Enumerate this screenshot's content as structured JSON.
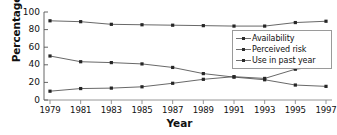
{
  "chart_data": {
    "type": "line",
    "title": "",
    "xlabel": "Year",
    "ylabel": "Percentage",
    "categories": [
      "1979",
      "1981",
      "1983",
      "1985",
      "1987",
      "1989",
      "1991",
      "1993",
      "1995",
      "1997"
    ],
    "x": [
      1979,
      1981,
      1983,
      1985,
      1987,
      1989,
      1991,
      1993,
      1995,
      1997
    ],
    "xlim": [
      1978,
      1998
    ],
    "ylim": [
      0,
      100
    ],
    "yticks": [
      0,
      20,
      40,
      60,
      80,
      100
    ],
    "ytick_labels": [
      "0",
      "20",
      "40",
      "60",
      "80",
      "100"
    ],
    "grid": false,
    "legend_position": "upper right",
    "marker": "square",
    "series": [
      {
        "name": "Availability",
        "color": "#4d4d4d",
        "values": [
          90,
          89,
          86,
          85.5,
          85,
          84.5,
          84,
          84,
          88,
          89.5
        ]
      },
      {
        "name": "Perceived risk",
        "color": "#4d4d4d",
        "values": [
          50,
          43.5,
          42.5,
          41,
          37,
          30,
          26,
          23,
          17,
          15.5
        ]
      },
      {
        "name": "Use in past year",
        "color": "#4d4d4d",
        "values": [
          10,
          13,
          13.5,
          15,
          19,
          23.5,
          26.5,
          24.5,
          35,
          39
        ]
      }
    ]
  },
  "axes": {
    "ylabel": "Percentage",
    "xlabel": "Year"
  },
  "legend": {
    "items": [
      {
        "label": "Availability"
      },
      {
        "label": "Perceived risk"
      },
      {
        "label": "Use in past year"
      }
    ]
  }
}
